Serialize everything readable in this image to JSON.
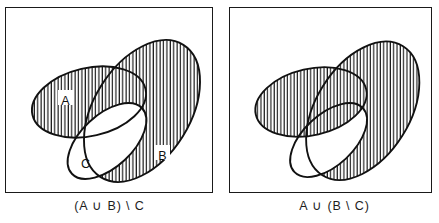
{
  "figure": {
    "background_color": "#ffffff",
    "stroke_color": "#111111",
    "hatch_color": "#111111",
    "panel_count": 2
  },
  "panels": [
    {
      "id": "left",
      "caption": "(A ∪ B) \\ C",
      "caption_plain": "(A union B) minus C",
      "shaded_description": "Everything in A or B that is not in C",
      "set_labels": [
        {
          "name": "A",
          "text": "A",
          "x": 59,
          "y": 93
        },
        {
          "name": "B",
          "text": "B",
          "x": 156,
          "y": 148
        },
        {
          "name": "C",
          "text": "C",
          "x": 79,
          "y": 156
        }
      ],
      "ellipses": [
        {
          "name": "A",
          "cx": 83,
          "cy": 94,
          "rx": 58,
          "ry": 34,
          "rotate": -13
        },
        {
          "name": "B",
          "cx": 136,
          "cy": 103,
          "rx": 78,
          "ry": 48,
          "rotate": -58
        },
        {
          "name": "C",
          "cx": 101,
          "cy": 133,
          "rx": 48,
          "ry": 26,
          "rotate": -43
        }
      ]
    },
    {
      "id": "right",
      "caption": "A ∪ (B \\ C)",
      "caption_plain": "A union (B minus C)",
      "shaded_description": "All of A, together with the part of B outside C",
      "set_labels": [],
      "ellipses": [
        {
          "name": "A",
          "cx": 83,
          "cy": 94,
          "rx": 58,
          "ry": 34,
          "rotate": -13
        },
        {
          "name": "B",
          "cx": 136,
          "cy": 103,
          "rx": 78,
          "ry": 48,
          "rotate": -58
        },
        {
          "name": "C",
          "cx": 101,
          "cy": 133,
          "rx": 48,
          "ry": 26,
          "rotate": -43
        }
      ]
    }
  ],
  "hatch": {
    "style": "vertical-lines",
    "spacing_px": 3.4,
    "line_width_px": 1.15
  },
  "symbols": {
    "union": "∪",
    "set_minus": "\\"
  }
}
